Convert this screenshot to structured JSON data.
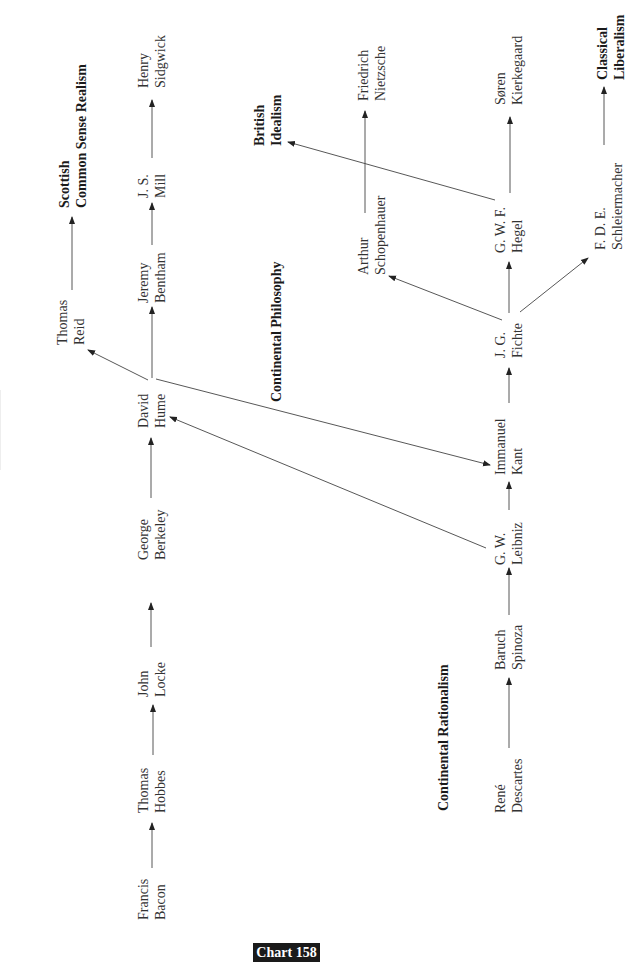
{
  "badge": {
    "label": "Chart 158"
  },
  "schools": {
    "scottish": {
      "line1": "Scottish",
      "line2": "Common Sense Realism"
    },
    "continental_philosophy": {
      "line1": "Continental Philosophy"
    },
    "british_idealism": {
      "line1": "British",
      "line2": "Idealism"
    },
    "continental_rationalism": {
      "line1": "Continental Rationalism"
    },
    "classical_liberalism": {
      "line1": "Classical",
      "line2": "Liberalism"
    }
  },
  "nodes": {
    "bacon": {
      "first": "Francis",
      "last": "Bacon"
    },
    "hobbes": {
      "first": "Thomas",
      "last": "Hobbes"
    },
    "locke": {
      "first": "John",
      "last": "Locke"
    },
    "berkeley": {
      "first": "George",
      "last": "Berkeley"
    },
    "hume": {
      "first": "David",
      "last": "Hume"
    },
    "bentham": {
      "first": "Jeremy",
      "last": "Bentham"
    },
    "mill": {
      "first": "J. S.",
      "last": "Mill"
    },
    "sidgwick": {
      "first": "Henry",
      "last": "Sidgwick"
    },
    "reid": {
      "first": "Thomas",
      "last": "Reid"
    },
    "descartes": {
      "first": "René",
      "last": "Descartes"
    },
    "spinoza": {
      "first": "Baruch",
      "last": "Spinoza"
    },
    "leibniz": {
      "first": "G. W.",
      "last": "Leibniz"
    },
    "kant": {
      "first": "Immanuel",
      "last": "Kant"
    },
    "fichte": {
      "first": "J. G.",
      "last": "Fichte"
    },
    "hegel": {
      "first": "G. W. F.",
      "last": "Hegel"
    },
    "kierkegaard": {
      "first": "Søren",
      "last": "Kierkegaard"
    },
    "schopenhauer": {
      "first": "Arthur",
      "last": "Schopenhauer"
    },
    "nietzsche": {
      "first": "Friedrich",
      "last": "Nietzsche"
    },
    "schleiermacher": {
      "first": "F. D. E.",
      "last": "Schleiermacher"
    }
  },
  "edges": [
    {
      "from": "Francis Bacon",
      "to": "Thomas Hobbes"
    },
    {
      "from": "Thomas Hobbes",
      "to": "John Locke"
    },
    {
      "from": "John Locke",
      "to": "George Berkeley"
    },
    {
      "from": "George Berkeley",
      "to": "David Hume"
    },
    {
      "from": "David Hume",
      "to": "Jeremy Bentham"
    },
    {
      "from": "Jeremy Bentham",
      "to": "J. S. Mill"
    },
    {
      "from": "J. S. Mill",
      "to": "Henry Sidgwick"
    },
    {
      "from": "David Hume",
      "to": "Thomas Reid"
    },
    {
      "from": "Thomas Reid",
      "to": "Scottish Common Sense Realism"
    },
    {
      "from": "David Hume",
      "to": "Immanuel Kant"
    },
    {
      "from": "René Descartes",
      "to": "Baruch Spinoza"
    },
    {
      "from": "Baruch Spinoza",
      "to": "G. W. Leibniz"
    },
    {
      "from": "G. W. Leibniz",
      "to": "Immanuel Kant"
    },
    {
      "from": "G. W. Leibniz",
      "to": "David Hume"
    },
    {
      "from": "Immanuel Kant",
      "to": "J. G. Fichte"
    },
    {
      "from": "J. G. Fichte",
      "to": "G. W. F. Hegel"
    },
    {
      "from": "J. G. Fichte",
      "to": "Arthur Schopenhauer"
    },
    {
      "from": "J. G. Fichte",
      "to": "F. D. E. Schleiermacher"
    },
    {
      "from": "G. W. F. Hegel",
      "to": "Søren Kierkegaard"
    },
    {
      "from": "G. W. F. Hegel",
      "to": "British Idealism"
    },
    {
      "from": "Arthur Schopenhauer",
      "to": "Friedrich Nietzsche"
    },
    {
      "from": "F. D. E. Schleiermacher",
      "to": "Classical Liberalism"
    }
  ]
}
